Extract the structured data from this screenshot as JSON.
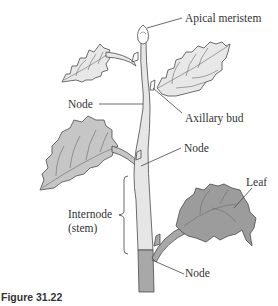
{
  "figure": {
    "caption": "Figure 31.22",
    "labels": {
      "apical_meristem": "Apical meristem",
      "node_upper": "Node",
      "axillary_bud": "Axillary bud",
      "node_middle": "Node",
      "internode_line1": "Internode",
      "internode_line2": "(stem)",
      "leaf": "Leaf",
      "node_lower": "Node"
    },
    "colors": {
      "upper_stem": "#e6e6e6",
      "lower_stem": "#a8a8a8",
      "upper_leaves": "#e8e8e8",
      "middle_leaf": "#c6c6c6",
      "lower_leaf": "#9c9c9c",
      "outline": "#4a4a4a",
      "text": "#333333"
    }
  }
}
